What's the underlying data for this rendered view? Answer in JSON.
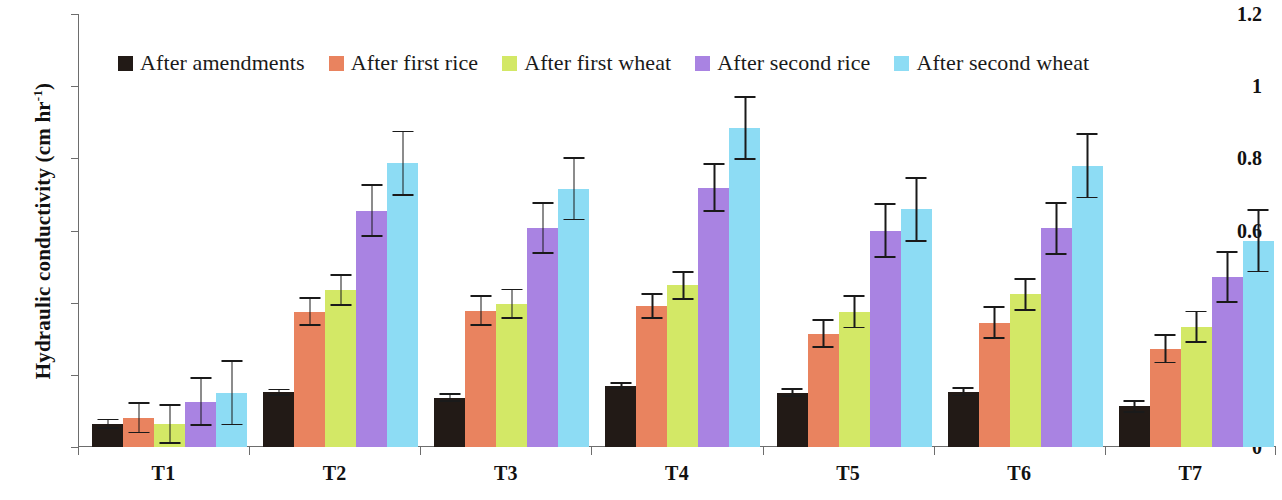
{
  "chart_data": {
    "type": "bar",
    "title": "",
    "xlabel": "",
    "ylabel": "Hydraulic conductivity (cm hr-1)",
    "ylabel_main": "Hydraulic conductivity (cm hr",
    "ylabel_sup": "-1",
    "ylabel_tail": ")",
    "ylim": [
      0,
      1.2
    ],
    "ytick_labels": [
      "1.2",
      "1",
      "0.8",
      "0.6",
      "0.4",
      "0.2",
      "0"
    ],
    "ytick_values": [
      1.2,
      1,
      0.8,
      0.6,
      0.4,
      0.2,
      0
    ],
    "grid": false,
    "legend_position": "top-left-inside",
    "categories": [
      "T1",
      "T2",
      "T3",
      "T4",
      "T5",
      "T6",
      "T7"
    ],
    "series": [
      {
        "name": "After amendments",
        "color": "#221a16",
        "values": [
          0.065,
          0.152,
          0.137,
          0.17,
          0.151,
          0.153,
          0.113
        ],
        "errors": [
          0.014,
          0.01,
          0.013,
          0.01,
          0.013,
          0.013,
          0.018
        ]
      },
      {
        "name": "After first rice",
        "color": "#e9835f",
        "values": [
          0.081,
          0.375,
          0.378,
          0.39,
          0.314,
          0.345,
          0.272
        ],
        "errors": [
          0.043,
          0.04,
          0.042,
          0.036,
          0.04,
          0.045,
          0.04
        ]
      },
      {
        "name": "After first wheat",
        "color": "#d3e866",
        "values": [
          0.064,
          0.435,
          0.397,
          0.448,
          0.375,
          0.423,
          0.333
        ],
        "errors": [
          0.056,
          0.045,
          0.042,
          0.04,
          0.046,
          0.045,
          0.045
        ]
      },
      {
        "name": "After second rice",
        "color": "#a983e2",
        "values": [
          0.126,
          0.655,
          0.607,
          0.719,
          0.6,
          0.606,
          0.472
        ],
        "errors": [
          0.068,
          0.073,
          0.072,
          0.068,
          0.075,
          0.073,
          0.072
        ]
      },
      {
        "name": "After second wheat",
        "color": "#8ddcf4",
        "values": [
          0.151,
          0.787,
          0.716,
          0.884,
          0.659,
          0.779,
          0.572
        ],
        "errors": [
          0.091,
          0.09,
          0.088,
          0.088,
          0.09,
          0.09,
          0.088
        ]
      }
    ]
  }
}
